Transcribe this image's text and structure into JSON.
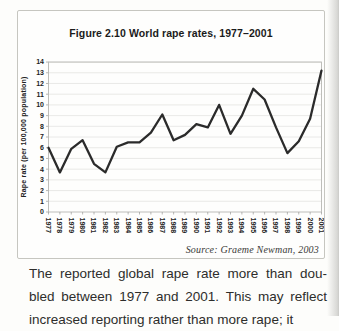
{
  "figure": {
    "title": "Figure 2.10 World rape rates, 1977–2001",
    "source": "Source: Graeme Newman, 2003"
  },
  "chart_data": {
    "type": "line",
    "title": "Figure 2.10 World rape rates, 1977–2001",
    "xlabel": "",
    "ylabel": "Rape rate (per 100,000 population)",
    "ylim": [
      0,
      14
    ],
    "ytick_step": 1,
    "grid": true,
    "legend_position": "none",
    "categories": [
      "1977",
      "1978",
      "1979",
      "1980",
      "1981",
      "1982",
      "1983",
      "1984",
      "1985",
      "1986",
      "1987",
      "1988",
      "1989",
      "1990",
      "1991",
      "1992",
      "1993",
      "1994",
      "1995",
      "1996",
      "1997",
      "1998",
      "1999",
      "2000",
      "2001"
    ],
    "values": [
      6.0,
      3.7,
      5.9,
      6.7,
      4.5,
      3.7,
      6.1,
      6.5,
      6.5,
      7.4,
      9.1,
      6.7,
      7.2,
      8.2,
      7.9,
      10.0,
      7.3,
      9.0,
      11.5,
      10.5,
      7.9,
      5.5,
      6.6,
      8.7,
      13.2
    ],
    "line_color": "#2b2b2b",
    "grid_color": "#e7e7e4",
    "frame_color": "#b8b8b3"
  },
  "body_text": {
    "lines": [
      "The reported global rape rate more than dou-",
      "bled between 1977 and 2001. This may reflect",
      "increased reporting rather than more rape; it"
    ]
  }
}
